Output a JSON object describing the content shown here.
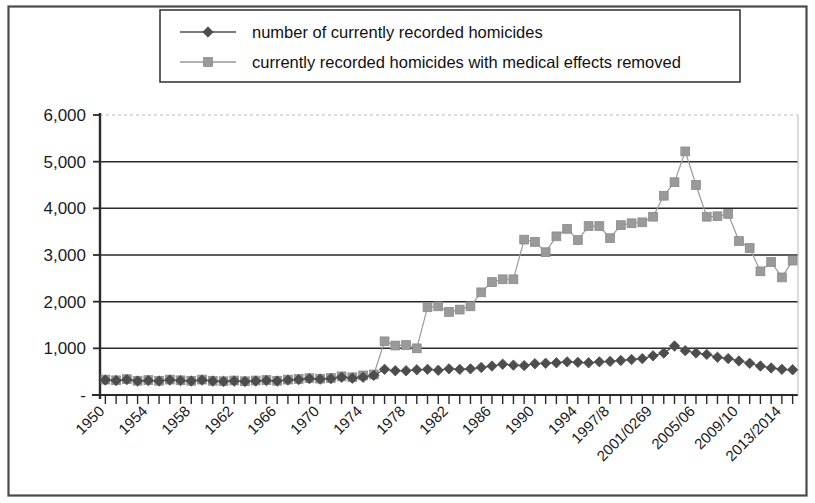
{
  "chart_data": {
    "type": "line",
    "title": "",
    "subtitle": "",
    "xlabel": "",
    "ylabel": "",
    "ylim": [
      0,
      6000
    ],
    "ytick_labels": [
      "6,000",
      "5,000",
      "4,000",
      "3,000",
      "2,000",
      "1,000",
      "-"
    ],
    "ytick_values": [
      6000,
      5000,
      4000,
      3000,
      2000,
      1000,
      0
    ],
    "grid": true,
    "legend_position": "top-right",
    "xtick_labels": [
      "1950",
      "1954",
      "1958",
      "1962",
      "1966",
      "1970",
      "1974",
      "1978",
      "1982",
      "1986",
      "1990",
      "1994",
      "1997/8",
      "2001/0269",
      "2005/06",
      "2009/10",
      "2013/2014"
    ],
    "x": [
      "1950",
      "1951",
      "1952",
      "1953",
      "1954",
      "1955",
      "1956",
      "1957",
      "1958",
      "1959",
      "1960",
      "1961",
      "1962",
      "1963",
      "1964",
      "1965",
      "1966",
      "1967",
      "1968",
      "1969",
      "1970",
      "1971",
      "1972",
      "1973",
      "1974",
      "1975",
      "1976",
      "1977",
      "1978",
      "1979",
      "1980",
      "1981",
      "1982",
      "1983",
      "1984",
      "1985",
      "1986",
      "1987",
      "1988",
      "1989",
      "1990",
      "1991",
      "1992",
      "1993",
      "1994",
      "1995",
      "1996",
      "1997/8",
      "1998/9",
      "1999/00",
      "2000/01",
      "2001/02",
      "2002/03",
      "2003/04",
      "2004/05",
      "2005/06",
      "2006/07",
      "2007/08",
      "2008/09",
      "2009/10",
      "2010/11",
      "2011/12",
      "2012/13",
      "2013/2014",
      "2014/15"
    ],
    "series": [
      {
        "name": "number of currently recorded  homicides",
        "color": "#4d4d4d",
        "marker": "diamond",
        "values": [
          320,
          310,
          330,
          300,
          310,
          300,
          320,
          310,
          300,
          320,
          300,
          290,
          300,
          290,
          300,
          310,
          300,
          320,
          330,
          350,
          340,
          350,
          380,
          360,
          380,
          420,
          550,
          520,
          520,
          540,
          550,
          530,
          560,
          550,
          560,
          590,
          620,
          660,
          640,
          630,
          670,
          680,
          690,
          710,
          700,
          690,
          710,
          720,
          740,
          760,
          780,
          840,
          900,
          1050,
          950,
          900,
          870,
          810,
          780,
          730,
          680,
          620,
          580,
          550,
          540
        ]
      },
      {
        "name": "currently recorded homicides with medical effects removed",
        "color": "#9a9a9a",
        "marker": "square",
        "values": [
          330,
          315,
          340,
          305,
          320,
          305,
          330,
          315,
          305,
          330,
          305,
          295,
          310,
          295,
          310,
          320,
          305,
          330,
          345,
          360,
          350,
          365,
          400,
          380,
          420,
          440,
          1150,
          1060,
          1070,
          1000,
          1880,
          1900,
          1780,
          1830,
          1900,
          2200,
          2420,
          2480,
          2480,
          3330,
          3280,
          3060,
          3400,
          3560,
          3320,
          3620,
          3620,
          3360,
          3640,
          3680,
          3700,
          3820,
          4270,
          4560,
          5220,
          4500,
          3820,
          3830,
          3880,
          3300,
          3150,
          2650,
          2850,
          2520,
          2880
        ]
      }
    ]
  },
  "legend": {
    "items": [
      {
        "label": "number of currently recorded  homicides",
        "marker": "diamond",
        "color": "#4d4d4d"
      },
      {
        "label": "currently recorded homicides with medical effects removed",
        "marker": "square",
        "color": "#9a9a9a"
      }
    ]
  }
}
